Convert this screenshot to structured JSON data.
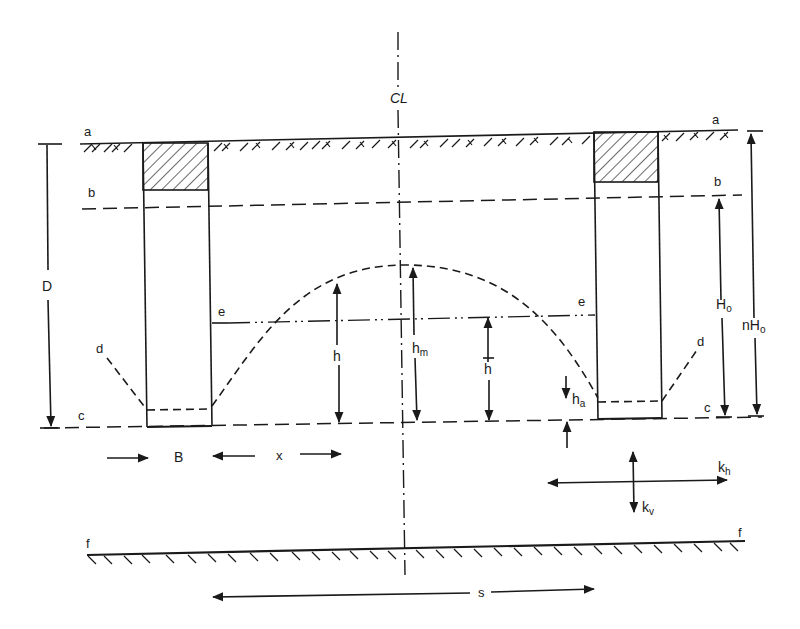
{
  "diagram": {
    "centerline_label": "CL",
    "levels": {
      "a": "a",
      "b": "b",
      "c": "c",
      "d": "d",
      "e": "e",
      "f": "f"
    },
    "dimensions": {
      "D": "D",
      "H0_main": "H",
      "H0_sub": "o",
      "nH0_prefix": "nH",
      "nH0_sub": "o",
      "h": "h",
      "hm_main": "h",
      "hm_sub": "m",
      "hbar": "h",
      "ha_main": "h",
      "ha_sub": "a",
      "B": "B",
      "x": "x",
      "s": "s",
      "kh_main": "k",
      "kh_sub": "h",
      "kv_main": "k",
      "kv_sub": "v"
    },
    "elements": {
      "left_trench": "left drain trench with backfill",
      "right_trench": "right drain trench with backfill",
      "water_table_curve": "phreatic surface (dashed)",
      "ground_surface": "ground surface a–a",
      "impermeable_layer": "impermeable layer f–f"
    }
  }
}
